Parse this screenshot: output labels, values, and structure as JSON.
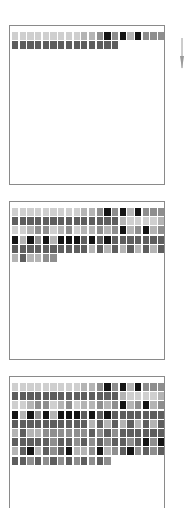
{
  "diagram": {
    "shade_palette": {
      "s0": "#cfcfcf",
      "s1": "#b4b4b4",
      "s2": "#8e8e8e",
      "s3": "#5e5e5e",
      "s4": "#141414"
    },
    "border_color": "#8a8a8a",
    "columns_per_row": 20,
    "rows_master": [
      [
        0,
        0,
        0,
        0,
        0,
        0,
        0,
        0,
        0,
        1,
        1,
        2,
        4,
        2,
        4,
        1,
        4,
        2,
        2,
        2
      ],
      [
        3,
        3,
        3,
        3,
        3,
        3,
        3,
        3,
        3,
        3,
        3,
        3,
        3,
        3,
        1,
        0,
        0,
        0,
        0,
        1
      ],
      [
        0,
        0,
        1,
        2,
        2,
        0,
        1,
        2,
        0,
        1,
        1,
        2,
        1,
        2,
        4,
        1,
        2,
        4,
        1,
        2
      ],
      [
        4,
        1,
        4,
        2,
        4,
        1,
        4,
        4,
        4,
        3,
        4,
        3,
        4,
        3,
        3,
        3,
        3,
        3,
        3,
        3
      ],
      [
        3,
        3,
        3,
        3,
        3,
        3,
        3,
        3,
        3,
        3,
        1,
        3,
        1,
        3,
        1,
        3,
        1,
        3,
        1,
        3
      ],
      [
        1,
        3,
        1,
        1,
        2,
        2,
        2,
        2,
        2,
        2,
        3,
        2,
        3,
        2,
        3,
        3,
        3,
        3,
        3,
        3
      ],
      [
        3,
        3,
        3,
        3,
        3,
        2,
        3,
        3,
        2,
        3,
        2,
        3,
        2,
        3,
        3,
        2,
        3,
        4,
        2,
        4
      ],
      [
        1,
        3,
        4,
        1,
        3,
        2,
        3,
        4,
        1,
        1,
        2,
        4,
        1,
        2,
        3,
        4,
        2,
        3,
        2,
        3
      ],
      [
        3,
        3,
        2,
        3,
        2,
        3,
        2,
        3,
        2,
        3,
        2,
        3,
        2,
        3
      ]
    ],
    "panels": [
      {
        "id": "panel-1",
        "top": 25,
        "height": 160,
        "row_lengths": [
          20,
          14
        ],
        "row_source": [
          0,
          1
        ]
      },
      {
        "id": "panel-2",
        "top": 201,
        "height": 159,
        "row_lengths": [
          20,
          20,
          20,
          20,
          20,
          6
        ],
        "row_source": [
          0,
          1,
          2,
          3,
          4,
          5
        ]
      },
      {
        "id": "panel-3",
        "top": 376,
        "height": 132,
        "row_lengths": [
          20,
          20,
          20,
          20,
          20,
          20,
          20,
          20,
          13
        ],
        "row_source": [
          0,
          1,
          2,
          3,
          4,
          5,
          6,
          7,
          8
        ],
        "open_bottom": true
      }
    ],
    "arrow": {
      "icon": "down-arrow-icon",
      "direction": "down",
      "color": "#9a9a9a"
    }
  }
}
